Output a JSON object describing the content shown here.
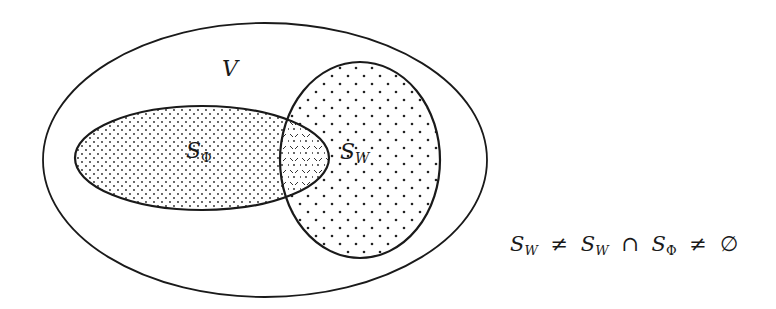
{
  "diagram": {
    "type": "venn",
    "universe": {
      "label": "V",
      "label_sub": ""
    },
    "sets": [
      {
        "id": "S_phi",
        "label": "S",
        "label_sub": "Φ",
        "fill": "dense-dots"
      },
      {
        "id": "S_w",
        "label": "S",
        "label_sub": "W",
        "fill": "sparse-dots"
      }
    ],
    "intersection": {
      "fill": "cross-hatch-dots"
    }
  },
  "formula": {
    "p1": "S",
    "p1_sub": "W",
    "op1": "≠",
    "p2": "S",
    "p2_sub": "W",
    "op2": "∩",
    "p3": "S",
    "p3_sub": "Φ",
    "op3": "≠",
    "p4": "∅"
  },
  "colors": {
    "stroke": "#1a1a1a",
    "background": "#ffffff",
    "dots": "#222222"
  }
}
